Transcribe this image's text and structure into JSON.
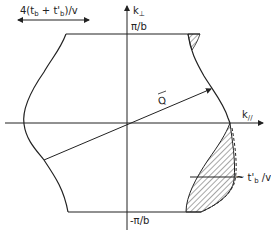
{
  "diagram": {
    "type": "fermi-surface-sketch",
    "labels": {
      "width_label": "4(t_b + t'_b)/v",
      "width_label_main": "4(t",
      "width_label_sub1": "b",
      "width_label_mid": " + t'",
      "width_label_sub2": "b",
      "width_label_end": ")/v",
      "k_perp_axis": "k",
      "k_perp_sub": "⊥",
      "k_par_axis": "k",
      "k_par_sub": "//",
      "top_boundary": "π/b",
      "bottom_boundary": "-π/b",
      "nesting_vector": "Q",
      "warping_label_prefix": "~ t'",
      "warping_label_sub": "b",
      "warping_label_suffix": " /v"
    },
    "colors": {
      "line": "#222222",
      "background": "#ffffff"
    }
  }
}
